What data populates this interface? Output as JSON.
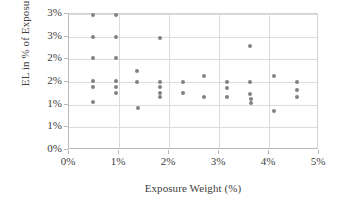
{
  "chart_data": {
    "type": "scatter",
    "title": "",
    "xlabel": "Exposure Weight (%)",
    "ylabel": "EL in % of Exposure",
    "xlim": [
      0,
      5
    ],
    "ylim": [
      0,
      3
    ],
    "grid": true,
    "legend": null,
    "marker_color": "#828282",
    "x_tick_values": [
      0,
      1,
      2,
      3,
      4,
      5
    ],
    "x_tick_labels": [
      "0%",
      "1%",
      "2%",
      "3%",
      "4%",
      "5%"
    ],
    "y_tick_values": [
      0,
      0.5,
      1.0,
      1.5,
      2.0,
      2.5,
      3.0
    ],
    "y_tick_labels": [
      "0%",
      "1%",
      "1%",
      "2%",
      "2%",
      "3%",
      "3%"
    ],
    "points": [
      {
        "x": 0.47,
        "y": 2.98
      },
      {
        "x": 0.47,
        "y": 2.5
      },
      {
        "x": 0.47,
        "y": 2.02
      },
      {
        "x": 0.47,
        "y": 1.53
      },
      {
        "x": 0.47,
        "y": 1.39
      },
      {
        "x": 0.47,
        "y": 1.06
      },
      {
        "x": 0.93,
        "y": 2.98
      },
      {
        "x": 0.93,
        "y": 2.5
      },
      {
        "x": 0.93,
        "y": 2.02
      },
      {
        "x": 0.93,
        "y": 1.53
      },
      {
        "x": 0.93,
        "y": 1.39
      },
      {
        "x": 0.93,
        "y": 1.26
      },
      {
        "x": 1.36,
        "y": 1.75
      },
      {
        "x": 1.36,
        "y": 1.51
      },
      {
        "x": 1.37,
        "y": 0.92
      },
      {
        "x": 1.81,
        "y": 2.46
      },
      {
        "x": 1.81,
        "y": 1.51
      },
      {
        "x": 1.81,
        "y": 1.38
      },
      {
        "x": 1.81,
        "y": 1.26
      },
      {
        "x": 1.81,
        "y": 1.17
      },
      {
        "x": 2.27,
        "y": 1.5
      },
      {
        "x": 2.28,
        "y": 1.26
      },
      {
        "x": 2.7,
        "y": 1.63
      },
      {
        "x": 2.7,
        "y": 1.17
      },
      {
        "x": 3.16,
        "y": 1.49
      },
      {
        "x": 3.16,
        "y": 1.37
      },
      {
        "x": 3.16,
        "y": 1.17
      },
      {
        "x": 3.62,
        "y": 2.29
      },
      {
        "x": 3.62,
        "y": 1.49
      },
      {
        "x": 3.62,
        "y": 1.24
      },
      {
        "x": 3.63,
        "y": 1.13
      },
      {
        "x": 3.63,
        "y": 1.03
      },
      {
        "x": 4.09,
        "y": 1.63
      },
      {
        "x": 4.1,
        "y": 0.87
      },
      {
        "x": 4.55,
        "y": 1.49
      },
      {
        "x": 4.55,
        "y": 1.32
      },
      {
        "x": 4.55,
        "y": 1.16
      }
    ]
  }
}
